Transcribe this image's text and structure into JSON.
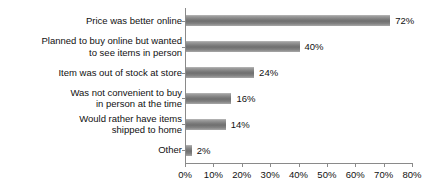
{
  "chart_data": {
    "type": "bar",
    "orientation": "horizontal",
    "title": "",
    "subtitle": "",
    "xlabel": "",
    "ylabel": "",
    "xlim": [
      0,
      80
    ],
    "grid": false,
    "legend": false,
    "value_suffix": "%",
    "bar_color": "#7d7d7d",
    "axis_color": "#8a8a8a",
    "text_color": "#111111",
    "background_color": "#ffffff",
    "categories": [
      "Price was better online",
      "Planned to buy online but wanted to see items in person",
      "Item was out of stock at store",
      "Was not convenient to buy in person at the time",
      "Would rather have items shipped to home",
      "Other"
    ],
    "category_lines": [
      [
        "Price was better online"
      ],
      [
        "Planned to buy online but wanted",
        "to see items in person"
      ],
      [
        "Item was out of stock at store"
      ],
      [
        "Was not convenient to buy",
        "in person at the time"
      ],
      [
        "Would rather have items",
        "shipped to home"
      ],
      [
        "Other"
      ]
    ],
    "values": [
      72,
      40,
      24,
      16,
      14,
      2
    ],
    "data_labels": [
      "72%",
      "40%",
      "24%",
      "16%",
      "14%",
      "2%"
    ],
    "xticks": [
      0,
      10,
      20,
      30,
      40,
      50,
      60,
      70,
      80
    ],
    "xtick_labels": [
      "0%",
      "10%",
      "20%",
      "30%",
      "40%",
      "50%",
      "60%",
      "70%",
      "80%"
    ]
  }
}
